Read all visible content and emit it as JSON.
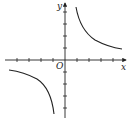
{
  "diagram": {
    "type": "function-graph",
    "function": "y = k/x (k > 0), hyperbola in quadrants I and III",
    "labels": {
      "x_axis": "x",
      "y_axis": "y",
      "origin": "O"
    },
    "axes": {
      "x_ticks_negative": 4,
      "x_ticks_positive": 4,
      "y_ticks_positive": 3,
      "y_ticks_negative": 4
    },
    "colors": {
      "background": "#ffffff",
      "stroke": "#222222"
    }
  }
}
